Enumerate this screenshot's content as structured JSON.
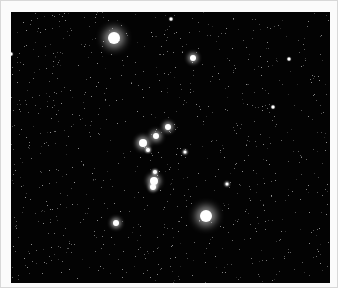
{
  "image": {
    "subject": "star-field",
    "description": "Night sky star field with bright stars (Orion-like pattern)",
    "background_color": "#030303",
    "border_color": "#fbfbfb",
    "stars": [
      {
        "x": 113,
        "y": 37,
        "r": 6,
        "glow": 8
      },
      {
        "x": 192,
        "y": 57,
        "r": 3,
        "glow": 4
      },
      {
        "x": 155,
        "y": 135,
        "r": 3,
        "glow": 5
      },
      {
        "x": 142,
        "y": 142,
        "r": 4,
        "glow": 5
      },
      {
        "x": 167,
        "y": 126,
        "r": 3,
        "glow": 4
      },
      {
        "x": 147,
        "y": 149,
        "r": 2,
        "glow": 2
      },
      {
        "x": 153,
        "y": 180,
        "r": 4,
        "glow": 5
      },
      {
        "x": 152,
        "y": 186,
        "r": 3,
        "glow": 3
      },
      {
        "x": 154,
        "y": 171,
        "r": 2,
        "glow": 2
      },
      {
        "x": 205,
        "y": 215,
        "r": 6,
        "glow": 8
      },
      {
        "x": 115,
        "y": 222,
        "r": 3,
        "glow": 4
      },
      {
        "x": 184,
        "y": 151,
        "r": 1.5,
        "glow": 2
      },
      {
        "x": 226,
        "y": 183,
        "r": 1.5,
        "glow": 2
      },
      {
        "x": 288,
        "y": 58,
        "r": 1.5,
        "glow": 1
      },
      {
        "x": 272,
        "y": 106,
        "r": 1.5,
        "glow": 1
      },
      {
        "x": 10,
        "y": 53,
        "r": 1.5,
        "glow": 1
      },
      {
        "x": 170,
        "y": 18,
        "r": 1.5,
        "glow": 1
      }
    ]
  }
}
